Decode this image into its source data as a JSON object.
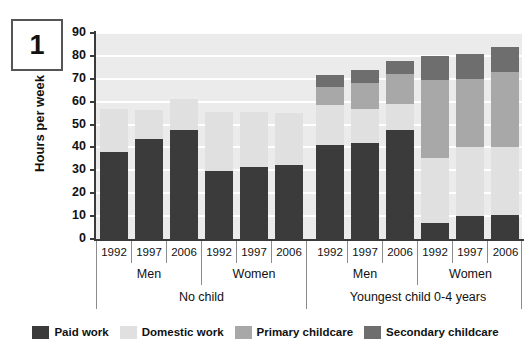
{
  "figure_number": "1",
  "axis": {
    "ylabel": "Hours per week",
    "yticks": [
      "0",
      "10",
      "20",
      "30",
      "40",
      "50",
      "60",
      "70",
      "80",
      "90"
    ]
  },
  "legend": {
    "items": [
      {
        "label": "Paid work",
        "color": "#3b3b3b"
      },
      {
        "label": "Domestic work",
        "color": "#e0e0e0"
      },
      {
        "label": "Primary childcare",
        "color": "#a8a8a8"
      },
      {
        "label": "Secondary childcare",
        "color": "#6e6e6e"
      }
    ]
  },
  "categories": {
    "years": [
      "1992",
      "1997",
      "2006",
      "1992",
      "1997",
      "2006",
      "1992",
      "1997",
      "2006",
      "1992",
      "1997",
      "2006"
    ],
    "sex": [
      "Men",
      "Women",
      "Men",
      "Women"
    ],
    "child": [
      "No child",
      "Youngest child 0-4 years"
    ]
  },
  "chart_data": {
    "type": "bar",
    "title": "",
    "xlabel": "",
    "ylabel": "Hours per week",
    "ylim": [
      0,
      90
    ],
    "ytick_step": 10,
    "grid": true,
    "stacked": true,
    "legend_position": "bottom",
    "categories": [
      "No child / Men / 1992",
      "No child / Men / 1997",
      "No child / Men / 2006",
      "No child / Women / 1992",
      "No child / Women / 1997",
      "No child / Women / 2006",
      "Youngest child 0-4 years / Men / 1992",
      "Youngest child 0-4 years / Men / 1997",
      "Youngest child 0-4 years / Men / 2006",
      "Youngest child 0-4 years / Women / 1992",
      "Youngest child 0-4 years / Women / 1997",
      "Youngest child 0-4 years / Women / 2006"
    ],
    "series": [
      {
        "name": "Paid work",
        "color": "#3b3b3b",
        "values": [
          38,
          43.5,
          47.5,
          29.5,
          31.5,
          32.5,
          41,
          42,
          47.5,
          7,
          10,
          10.5
        ]
      },
      {
        "name": "Domestic work",
        "color": "#e0e0e0",
        "values": [
          19,
          13,
          13.5,
          26,
          24,
          22.5,
          17.5,
          15,
          11.5,
          28.5,
          30,
          29.5
        ]
      },
      {
        "name": "Primary childcare",
        "color": "#a8a8a8",
        "values": [
          0,
          0,
          0,
          0,
          0,
          0,
          8,
          11,
          13,
          34,
          30,
          33
        ]
      },
      {
        "name": "Secondary childcare",
        "color": "#6e6e6e",
        "values": [
          0,
          0,
          0,
          0,
          0,
          0,
          5,
          6,
          6,
          10.5,
          11,
          11
        ]
      }
    ],
    "totals": [
      57,
      56.5,
      61,
      55.5,
      55.5,
      55,
      71.5,
      74,
      78,
      80,
      81,
      84
    ]
  }
}
